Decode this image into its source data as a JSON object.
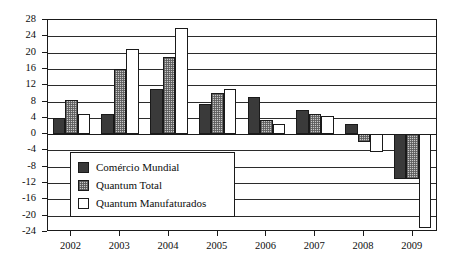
{
  "chart_data": {
    "type": "bar",
    "title": "",
    "subtitle": "",
    "xlabel": "",
    "ylabel": "",
    "categories": [
      "2002",
      "2003",
      "2004",
      "2005",
      "2006",
      "2007",
      "2008",
      "2009"
    ],
    "series": [
      {
        "name": "Comércio Mundial",
        "color": "#3a3a3a",
        "values": [
          4,
          5,
          11,
          7.5,
          9,
          6,
          2.5,
          -11
        ]
      },
      {
        "name": "Quantum Total",
        "color": "#c8c8c8",
        "values": [
          8.5,
          16,
          19,
          10,
          3.5,
          5,
          -2,
          -11
        ]
      },
      {
        "name": "Quantum Manufaturados",
        "color": "#ffffff",
        "values": [
          5,
          21,
          26,
          11,
          2.5,
          4.5,
          -4.5,
          -23
        ]
      }
    ],
    "ylim": [
      -24,
      28
    ],
    "ytick_step": 4,
    "yticks": [
      28,
      24,
      20,
      16,
      12,
      8,
      4,
      0,
      -4,
      -8,
      -12,
      -16,
      -20,
      -24
    ],
    "ytick_labels": [
      "28",
      "24",
      "20",
      "16",
      "12",
      "8",
      "4",
      "0",
      "-4",
      "-8",
      "-12",
      "-16",
      "-20",
      "-24"
    ],
    "grid": true,
    "grid_axis": "y",
    "legend_position": "inside-lower-left",
    "annotations": []
  },
  "legend": {
    "entries": [
      {
        "label": "Comércio Mundial"
      },
      {
        "label": "Quantum Total"
      },
      {
        "label": "Quantum Manufaturados"
      }
    ]
  }
}
